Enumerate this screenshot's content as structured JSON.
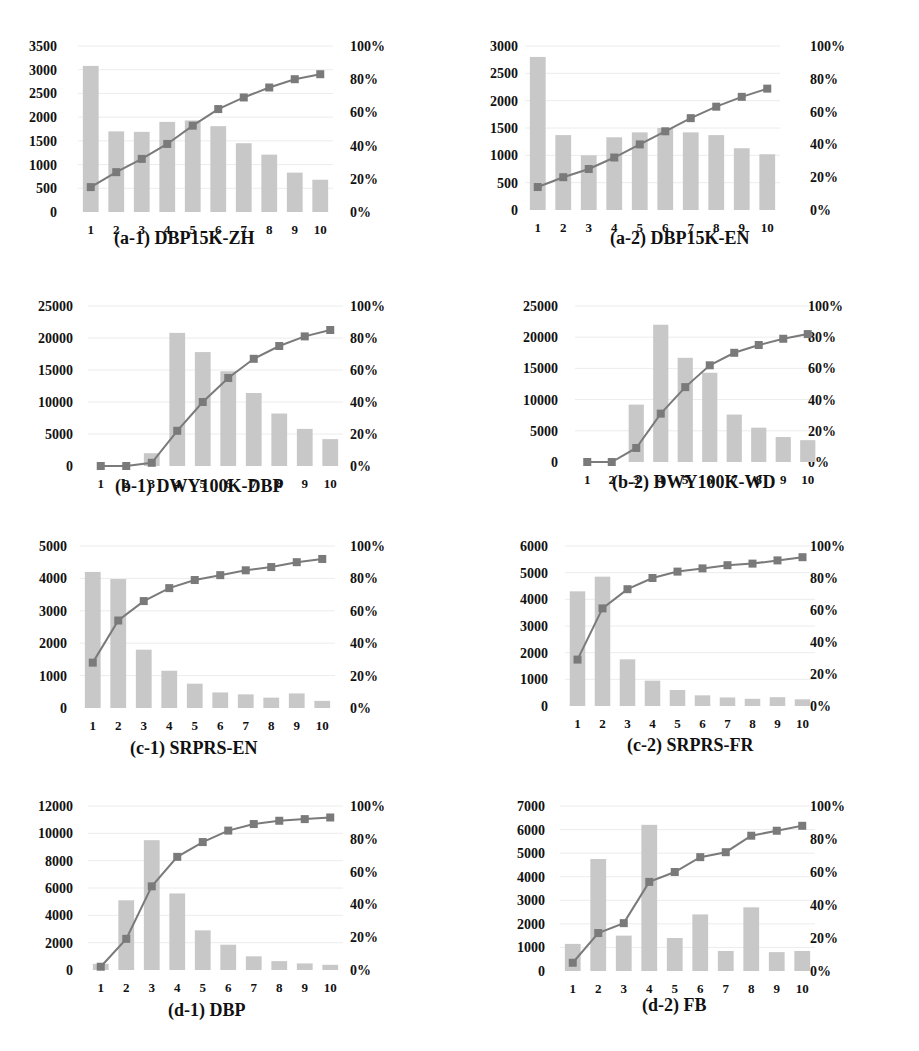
{
  "figure": {
    "layout": "4 rows x 2 columns of Pareto-style bar+line charts"
  },
  "colors": {
    "bar": "#c8c8c8",
    "line": "#7a7a7a",
    "marker": "#7a7a7a",
    "grid": "#ececec",
    "text": "#111111"
  },
  "chart_data": [
    {
      "id": "a1",
      "type": "bar+line",
      "title": "(a-1) DBP15K-ZH",
      "categories": [
        "1",
        "2",
        "3",
        "4",
        "5",
        "6",
        "7",
        "8",
        "9",
        "10"
      ],
      "series": [
        {
          "name": "count",
          "type": "bar",
          "axis": "left",
          "values": [
            3080,
            1700,
            1690,
            1900,
            1930,
            1810,
            1450,
            1210,
            830,
            680
          ]
        },
        {
          "name": "cumulative %",
          "type": "line",
          "axis": "right",
          "values": [
            15,
            24,
            32,
            41,
            52,
            62,
            69,
            75,
            80,
            83
          ]
        }
      ],
      "yleft": {
        "ticks": [
          "3500",
          "3000",
          "2500",
          "2000",
          "1500",
          "1000",
          "500",
          "0"
        ],
        "range": [
          0,
          3500
        ]
      },
      "yright": {
        "ticks": [
          "100%",
          "80%",
          "60%",
          "40%",
          "20%",
          "0%"
        ],
        "range": [
          0,
          100
        ]
      }
    },
    {
      "id": "a2",
      "type": "bar+line",
      "title": "(a-2) DBP15K-EN",
      "categories": [
        "1",
        "2",
        "3",
        "4",
        "5",
        "6",
        "7",
        "8",
        "9",
        "10"
      ],
      "series": [
        {
          "name": "count",
          "type": "bar",
          "axis": "left",
          "values": [
            2800,
            1370,
            1000,
            1330,
            1420,
            1500,
            1420,
            1370,
            1130,
            1020
          ]
        },
        {
          "name": "cumulative %",
          "type": "line",
          "axis": "right",
          "values": [
            14,
            20,
            25,
            32,
            40,
            48,
            56,
            63,
            69,
            74
          ]
        }
      ],
      "yleft": {
        "ticks": [
          "3000",
          "2500",
          "2000",
          "1500",
          "1000",
          "500",
          "0"
        ],
        "range": [
          0,
          3000
        ]
      },
      "yright": {
        "ticks": [
          "100%",
          "80%",
          "60%",
          "40%",
          "20%",
          "0%"
        ],
        "range": [
          0,
          100
        ]
      }
    },
    {
      "id": "b1",
      "type": "bar+line",
      "title": "(b-1) DWY100K-DBP",
      "categories": [
        "1",
        "2",
        "3",
        "4",
        "5",
        "6",
        "7",
        "8",
        "9",
        "10"
      ],
      "series": [
        {
          "name": "count",
          "type": "bar",
          "axis": "left",
          "values": [
            0,
            0,
            2000,
            20800,
            17800,
            14800,
            11400,
            8200,
            5800,
            4200
          ]
        },
        {
          "name": "cumulative %",
          "type": "line",
          "axis": "right",
          "values": [
            0,
            0,
            2,
            22,
            40,
            55,
            67,
            75,
            81,
            85
          ]
        }
      ],
      "yleft": {
        "ticks": [
          "25000",
          "20000",
          "15000",
          "10000",
          "5000",
          "0"
        ],
        "range": [
          0,
          25000
        ]
      },
      "yright": {
        "ticks": [
          "100%",
          "80%",
          "60%",
          "40%",
          "20%",
          "0%"
        ],
        "range": [
          0,
          100
        ]
      }
    },
    {
      "id": "b2",
      "type": "bar+line",
      "title": "(b-2) DWY100K-WD",
      "categories": [
        "1",
        "2",
        "3",
        "4",
        "5",
        "6",
        "7",
        "8",
        "9",
        "10"
      ],
      "series": [
        {
          "name": "count",
          "type": "bar",
          "axis": "left",
          "values": [
            0,
            0,
            9200,
            22000,
            16700,
            14300,
            7600,
            5500,
            4000,
            3500
          ]
        },
        {
          "name": "cumulative %",
          "type": "line",
          "axis": "right",
          "values": [
            0,
            0,
            9,
            31,
            48,
            62,
            70,
            75,
            79,
            82
          ]
        }
      ],
      "yleft": {
        "ticks": [
          "25000",
          "20000",
          "15000",
          "10000",
          "5000",
          "0"
        ],
        "range": [
          0,
          25000
        ]
      },
      "yright": {
        "ticks": [
          "100%",
          "80%",
          "60%",
          "40%",
          "20%",
          "0%"
        ],
        "range": [
          0,
          100
        ]
      }
    },
    {
      "id": "c1",
      "type": "bar+line",
      "title": "(c-1) SRPRS-EN",
      "categories": [
        "1",
        "2",
        "3",
        "4",
        "5",
        "6",
        "7",
        "8",
        "9",
        "10"
      ],
      "series": [
        {
          "name": "count",
          "type": "bar",
          "axis": "left",
          "values": [
            4200,
            3980,
            1800,
            1150,
            750,
            480,
            420,
            320,
            450,
            220
          ]
        },
        {
          "name": "cumulative %",
          "type": "line",
          "axis": "right",
          "values": [
            28,
            54,
            66,
            74,
            79,
            82,
            85,
            87,
            90,
            92
          ]
        }
      ],
      "yleft": {
        "ticks": [
          "5000",
          "4000",
          "3000",
          "2000",
          "1000",
          "0"
        ],
        "range": [
          0,
          5000
        ]
      },
      "yright": {
        "ticks": [
          "100%",
          "80%",
          "60%",
          "40%",
          "20%",
          "0%"
        ],
        "range": [
          0,
          100
        ]
      }
    },
    {
      "id": "c2",
      "type": "bar+line",
      "title": "(c-2) SRPRS-FR",
      "categories": [
        "1",
        "2",
        "3",
        "4",
        "5",
        "6",
        "7",
        "8",
        "9",
        "10"
      ],
      "series": [
        {
          "name": "count",
          "type": "bar",
          "axis": "left",
          "values": [
            4300,
            4850,
            1750,
            950,
            600,
            400,
            320,
            270,
            330,
            250
          ]
        },
        {
          "name": "cumulative %",
          "type": "line",
          "axis": "right",
          "values": [
            29,
            61,
            73,
            80,
            84,
            86,
            88,
            89,
            91,
            93
          ]
        }
      ],
      "yleft": {
        "ticks": [
          "6000",
          "5000",
          "4000",
          "3000",
          "2000",
          "1000",
          "0"
        ],
        "range": [
          0,
          6000
        ]
      },
      "yright": {
        "ticks": [
          "100%",
          "80%",
          "60%",
          "40%",
          "20%",
          "0%"
        ],
        "range": [
          0,
          100
        ]
      }
    },
    {
      "id": "d1",
      "type": "bar+line",
      "title": "(d-1) DBP",
      "categories": [
        "1",
        "2",
        "3",
        "4",
        "5",
        "6",
        "7",
        "8",
        "9",
        "10"
      ],
      "series": [
        {
          "name": "count",
          "type": "bar",
          "axis": "left",
          "values": [
            450,
            5100,
            9500,
            5600,
            2900,
            1850,
            1000,
            650,
            480,
            380
          ]
        },
        {
          "name": "cumulative %",
          "type": "line",
          "axis": "right",
          "values": [
            2,
            19,
            51,
            69,
            78,
            85,
            89,
            91,
            92,
            93
          ]
        }
      ],
      "yleft": {
        "ticks": [
          "12000",
          "10000",
          "8000",
          "6000",
          "4000",
          "2000",
          "0"
        ],
        "range": [
          0,
          12000
        ]
      },
      "yright": {
        "ticks": [
          "100%",
          "80%",
          "60%",
          "40%",
          "20%",
          "0%"
        ],
        "range": [
          0,
          100
        ]
      }
    },
    {
      "id": "d2",
      "type": "bar+line",
      "title": "(d-2) FB",
      "categories": [
        "1",
        "2",
        "3",
        "4",
        "5",
        "6",
        "7",
        "8",
        "9",
        "10"
      ],
      "series": [
        {
          "name": "count",
          "type": "bar",
          "axis": "left",
          "values": [
            1150,
            4750,
            1500,
            6200,
            1400,
            2400,
            850,
            2700,
            800,
            850
          ]
        },
        {
          "name": "cumulative %",
          "type": "line",
          "axis": "right",
          "values": [
            5,
            23,
            29,
            54,
            60,
            69,
            72,
            82,
            85,
            88
          ]
        }
      ],
      "yleft": {
        "ticks": [
          "7000",
          "6000",
          "5000",
          "4000",
          "3000",
          "2000",
          "1000",
          "0"
        ],
        "range": [
          0,
          7000
        ]
      },
      "yright": {
        "ticks": [
          "100%",
          "80%",
          "60%",
          "40%",
          "20%",
          "0%"
        ],
        "range": [
          0,
          100
        ]
      }
    }
  ]
}
